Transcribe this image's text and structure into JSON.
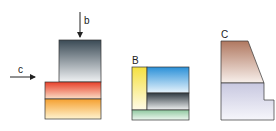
{
  "figures": {
    "a": {
      "arrow_b_label": "b",
      "arrow_c_label": "c",
      "colors": {
        "dark_top": "#3a4a55",
        "dark_bottom": "#f0f2f4",
        "red": "#e8402a",
        "orange": "#f5a030",
        "yellow_light": "#fff3d0"
      }
    },
    "b": {
      "label": "B",
      "colors": {
        "yellow": "#f5e040",
        "blue": "#2a90d8",
        "dark": "#303a42",
        "green": "#90c8a0"
      }
    },
    "c": {
      "label": "C",
      "colors": {
        "brown": "#b07860",
        "lavender": "#c8c8e0"
      }
    }
  }
}
